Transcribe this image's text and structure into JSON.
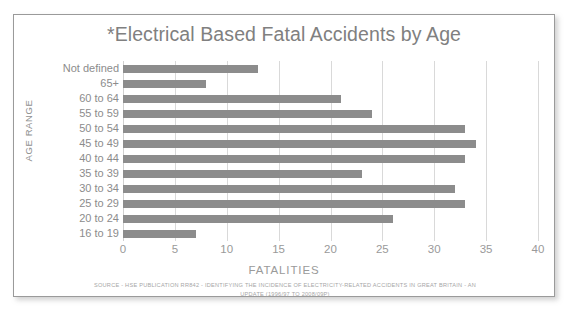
{
  "chart_data": {
    "type": "bar",
    "orientation": "horizontal",
    "title": "*Electrical Based Fatal Accidents by Age",
    "xlabel": "FATALITIES",
    "ylabel": "AGE RANGE",
    "xlim": [
      0,
      40
    ],
    "xticks": [
      "0",
      "5",
      "10",
      "15",
      "20",
      "25",
      "30",
      "35",
      "40"
    ],
    "xtick_values": [
      0,
      5,
      10,
      15,
      20,
      25,
      30,
      35,
      40
    ],
    "grid": "vertical",
    "legend": "none",
    "bar_color": "#8c8c8c",
    "categories": [
      "Not defined",
      "65+",
      "60 to 64",
      "55 to 59",
      "50 to 54",
      "45 to 49",
      "40 to 44",
      "35 to 39",
      "30 to 34",
      "25 to 29",
      "20 to 24",
      "16 to 19"
    ],
    "values": [
      13,
      8,
      21,
      24,
      33,
      34,
      33,
      23,
      32,
      33,
      26,
      7
    ],
    "annotations": {
      "source_line_1": "SOURCE - HSE PUBLICATION RR842 - IDENTIFYING THE INCIDENCE OF ELECTRICITY-RELATED ACCIDENTS IN GREAT BRITAIN - AN",
      "source_line_2": "UPDATE (1996/97 TO 2008/09P)"
    }
  },
  "colors": {
    "bar": "#8c8c8c",
    "gridline": "#d9d9d9",
    "text": "#8c8c8c",
    "title": "#808080",
    "border": "#9a9a9a",
    "background": "#ffffff"
  }
}
